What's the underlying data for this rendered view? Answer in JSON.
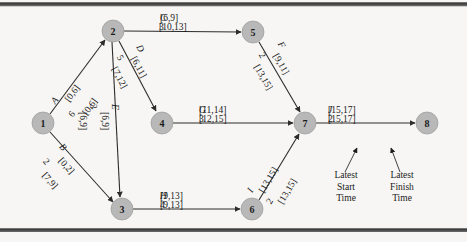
{
  "diagram": {
    "nodes": [
      {
        "id": "1",
        "label": "1",
        "cx": 43,
        "cy": 123
      },
      {
        "id": "2",
        "label": "2",
        "cx": 113,
        "cy": 31
      },
      {
        "id": "3",
        "label": "3",
        "cx": 122,
        "cy": 209
      },
      {
        "id": "4",
        "label": "4",
        "cx": 162,
        "cy": 123
      },
      {
        "id": "5",
        "label": "5",
        "cx": 253,
        "cy": 32
      },
      {
        "id": "6",
        "label": "6",
        "cx": 252,
        "cy": 209
      },
      {
        "id": "7",
        "label": "7",
        "cx": 305,
        "cy": 123
      },
      {
        "id": "8",
        "label": "8",
        "cx": 427,
        "cy": 123
      }
    ],
    "node_radius": 11,
    "edges": [
      {
        "id": "A",
        "from": "1",
        "to": "2",
        "activity": "A",
        "duration": "6",
        "earliest": "[0,6]",
        "latest": "[0,6]"
      },
      {
        "id": "B",
        "from": "1",
        "to": "3",
        "activity": "B",
        "duration": "2",
        "earliest": "[0,2]",
        "latest": "[7,9]"
      },
      {
        "id": "C",
        "from": "2",
        "to": "5",
        "activity": "C",
        "duration": "3",
        "earliest": "[6,9]",
        "latest": "[10,13]"
      },
      {
        "id": "D",
        "from": "2",
        "to": "4",
        "activity": "D",
        "duration": "5",
        "earliest": "[6,11]",
        "latest": "[7,12]"
      },
      {
        "id": "E",
        "from": "2",
        "to": "3",
        "activity": "E",
        "duration": "3",
        "earliest": "[6,9]",
        "latest": "[6,9]"
      },
      {
        "id": "F",
        "from": "5",
        "to": "7",
        "activity": "F",
        "duration": "2",
        "earliest": "[9,11]",
        "latest": "[13,15]"
      },
      {
        "id": "G",
        "from": "4",
        "to": "7",
        "activity": "G",
        "duration": "3",
        "earliest": "[11,14]",
        "latest": "[12,15]"
      },
      {
        "id": "H",
        "from": "3",
        "to": "6",
        "activity": "H",
        "duration": "4",
        "earliest": "[9,13]",
        "latest": "[9,13]"
      },
      {
        "id": "I",
        "from": "6",
        "to": "7",
        "activity": "I",
        "duration": "2",
        "earliest": "[13,15]",
        "latest": "[13,15]"
      },
      {
        "id": "J",
        "from": "7",
        "to": "8",
        "activity": "J",
        "duration": "2",
        "earliest": "[15,17]",
        "latest": "[15,17]"
      }
    ],
    "legend": [
      {
        "id": "latest-start",
        "line1": "Latest",
        "line2": "Start",
        "line3": "Time"
      },
      {
        "id": "latest-finish",
        "line1": "Latest",
        "line2": "Finish",
        "line3": "Time"
      }
    ],
    "colors": {
      "node_fill": "#b8b8b8",
      "edge_stroke": "#2c2c2c",
      "text": "#1a1a1a",
      "background": "#f7f6f4"
    }
  }
}
